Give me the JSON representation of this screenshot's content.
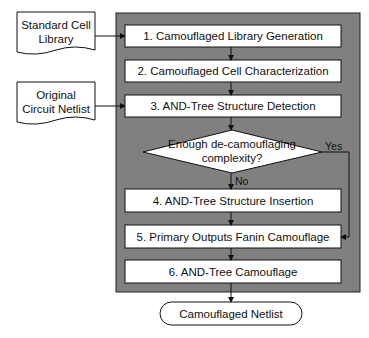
{
  "colors": {
    "panel": "#808080",
    "box_fill": "#ffffff",
    "stroke": "#111111"
  },
  "inputs": [
    {
      "lines": [
        "Standard Cell",
        "Library"
      ]
    },
    {
      "lines": [
        "Original",
        "Circuit Netlist"
      ]
    }
  ],
  "steps": [
    {
      "label": "1. Camouflaged Library Generation"
    },
    {
      "label": "2. Camouflaged Cell Characterization"
    },
    {
      "label": "3. AND-Tree Structure Detection"
    },
    {
      "label": "4. AND-Tree Structure Insertion"
    },
    {
      "label": "5. Primary Outputs Fanin Camouflage"
    },
    {
      "label": "6. AND-Tree Camouflage"
    }
  ],
  "decision": {
    "lines": [
      "Enough de-camouflaging",
      "complexity?"
    ],
    "yes_label": "Yes",
    "no_label": "No"
  },
  "output": {
    "label": "Camouflaged Netlist"
  }
}
